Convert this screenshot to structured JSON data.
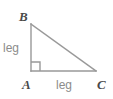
{
  "figure": {
    "kind": "right-triangle-geometry-diagram",
    "background_color": "#ffffff",
    "stroke_color": "#999999",
    "vertex_label_color": "#4a4a4a",
    "side_label_color": "#8c8c8c",
    "vertices": {
      "b": {
        "label": "B",
        "x": 31,
        "y": 24
      },
      "a": {
        "label": "A",
        "x": 31,
        "y": 71
      },
      "c": {
        "label": "C",
        "x": 96,
        "y": 71
      }
    },
    "sides": {
      "vertical_leg": {
        "label": "leg"
      },
      "horizontal_leg": {
        "label": "leg"
      }
    },
    "right_angle": {
      "at_vertex": "A",
      "marker": "square",
      "size": 9
    }
  }
}
